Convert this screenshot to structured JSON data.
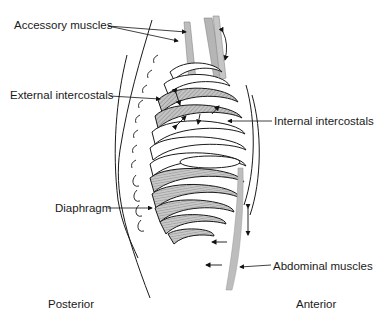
{
  "diagram": {
    "type": "anatomical-illustration",
    "labels": {
      "accessory_muscles": "Accessory muscles",
      "external_intercostals": "External intercostals",
      "internal_intercostals": "Internal intercostals",
      "diaphragm": "Diaphragm",
      "abdominal_muscles": "Abdominal muscles",
      "posterior": "Posterior",
      "anterior": "Anterior"
    },
    "colors": {
      "line": "#1a1a1a",
      "muscle_fill": "#b8b8b8",
      "hatch_fill": "#9a9a9a",
      "background": "#ffffff"
    }
  }
}
